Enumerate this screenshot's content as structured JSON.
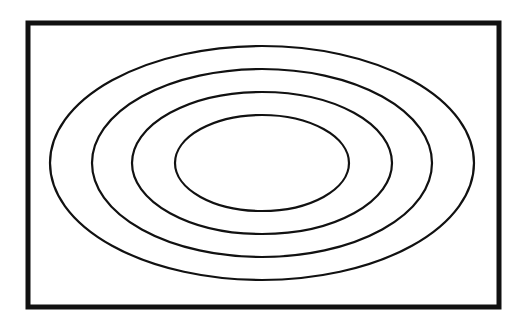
{
  "diagram": {
    "type": "concentric-ellipses",
    "background": "#ffffff",
    "stroke_color": "#111111",
    "frame": {
      "x": 28,
      "y": 23,
      "width": 471,
      "height": 284,
      "stroke_width": 5
    },
    "center": {
      "cx": 262,
      "cy": 163
    },
    "ellipses": [
      {
        "id": "outer",
        "rx": 212,
        "ry": 117,
        "stroke_width": 2.2
      },
      {
        "id": "second",
        "rx": 170,
        "ry": 94,
        "stroke_width": 2.2
      },
      {
        "id": "third",
        "rx": 130,
        "ry": 71,
        "stroke_width": 2.2
      },
      {
        "id": "inner",
        "rx": 87,
        "ry": 48,
        "stroke_width": 2.2
      }
    ]
  }
}
